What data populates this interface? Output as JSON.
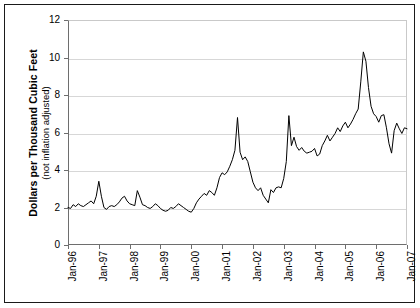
{
  "chart_data": {
    "type": "line",
    "title": "",
    "xlabel": "",
    "ylabel": "Dollars per Thousand Cubic Feet",
    "ylabel_sub": "(not inflation adjusted)",
    "ylim": [
      0,
      12
    ],
    "yticks": [
      0,
      2,
      4,
      6,
      8,
      10,
      12
    ],
    "ytick_labels": [
      "0",
      "2",
      "4",
      "6",
      "8",
      "10",
      "12"
    ],
    "grid": true,
    "grid_axis": "y",
    "legend": "none",
    "line_color": "#000000",
    "background_color": "#ffffff",
    "xtick_labels": [
      "Jan-96",
      "Jan-97",
      "Jan-98",
      "Jan-99",
      "Jan-00",
      "Jan-01",
      "Jan-02",
      "Jan-03",
      "Jan-04",
      "Jan-05",
      "Jan-06",
      "Jan-07"
    ],
    "xlim": [
      "Jan-96",
      "Jan-07"
    ],
    "x_start_index": 0,
    "x_points_per_tick": 12,
    "x": [
      "Jan-96",
      "Feb-96",
      "Mar-96",
      "Apr-96",
      "May-96",
      "Jun-96",
      "Jul-96",
      "Aug-96",
      "Sep-96",
      "Oct-96",
      "Nov-96",
      "Dec-96",
      "Jan-97",
      "Feb-97",
      "Mar-97",
      "Apr-97",
      "May-97",
      "Jun-97",
      "Jul-97",
      "Aug-97",
      "Sep-97",
      "Oct-97",
      "Nov-97",
      "Dec-97",
      "Jan-98",
      "Feb-98",
      "Mar-98",
      "Apr-98",
      "May-98",
      "Jun-98",
      "Jul-98",
      "Aug-98",
      "Sep-98",
      "Oct-98",
      "Nov-98",
      "Dec-98",
      "Jan-99",
      "Feb-99",
      "Mar-99",
      "Apr-99",
      "May-99",
      "Jun-99",
      "Jul-99",
      "Aug-99",
      "Sep-99",
      "Oct-99",
      "Nov-99",
      "Dec-99",
      "Jan-00",
      "Feb-00",
      "Mar-00",
      "Apr-00",
      "May-00",
      "Jun-00",
      "Jul-00",
      "Aug-00",
      "Sep-00",
      "Oct-00",
      "Nov-00",
      "Dec-00",
      "Jan-01",
      "Feb-01",
      "Mar-01",
      "Apr-01",
      "May-01",
      "Jun-01",
      "Jul-01",
      "Aug-01",
      "Sep-01",
      "Oct-01",
      "Nov-01",
      "Dec-01",
      "Jan-02",
      "Feb-02",
      "Mar-02",
      "Apr-02",
      "May-02",
      "Jun-02",
      "Jul-02",
      "Aug-02",
      "Sep-02",
      "Oct-02",
      "Nov-02",
      "Dec-02",
      "Jan-03",
      "Feb-03",
      "Mar-03",
      "Apr-03",
      "May-03",
      "Jun-03",
      "Jul-03",
      "Aug-03",
      "Sep-03",
      "Oct-03",
      "Nov-03",
      "Dec-03",
      "Jan-04",
      "Feb-04",
      "Mar-04",
      "Apr-04",
      "May-04",
      "Jun-04",
      "Jul-04",
      "Aug-04",
      "Sep-04",
      "Oct-04",
      "Nov-04",
      "Dec-04",
      "Jan-05",
      "Feb-05",
      "Mar-05",
      "Apr-05",
      "May-05",
      "Jun-05",
      "Jul-05",
      "Aug-05",
      "Sep-05",
      "Oct-05",
      "Nov-05",
      "Dec-05",
      "Jan-06",
      "Feb-06",
      "Mar-06",
      "Apr-06",
      "May-06",
      "Jun-06",
      "Jul-06",
      "Aug-06",
      "Sep-06",
      "Oct-06",
      "Nov-06",
      "Dec-06",
      "Jan-07"
    ],
    "values": [
      2.0,
      1.95,
      2.15,
      2.05,
      2.2,
      2.1,
      2.05,
      2.15,
      2.25,
      2.35,
      2.2,
      2.6,
      3.4,
      2.6,
      2.0,
      1.9,
      2.05,
      2.1,
      2.05,
      2.15,
      2.3,
      2.5,
      2.6,
      2.35,
      2.2,
      2.15,
      2.1,
      2.9,
      2.55,
      2.15,
      2.1,
      2.0,
      1.95,
      2.05,
      2.2,
      2.1,
      1.95,
      1.85,
      1.8,
      1.85,
      2.0,
      1.95,
      2.05,
      2.2,
      2.1,
      2.0,
      1.9,
      1.8,
      1.75,
      1.95,
      2.25,
      2.45,
      2.6,
      2.75,
      2.65,
      2.9,
      2.8,
      2.65,
      3.05,
      3.6,
      3.85,
      3.75,
      3.9,
      4.2,
      4.55,
      5.05,
      6.8,
      4.95,
      4.55,
      4.7,
      4.45,
      3.9,
      3.35,
      3.05,
      2.9,
      3.05,
      2.65,
      2.45,
      2.25,
      2.95,
      2.8,
      3.05,
      3.1,
      3.05,
      3.55,
      4.45,
      6.9,
      5.3,
      5.75,
      5.25,
      5.05,
      5.2,
      5.0,
      4.9,
      4.95,
      5.0,
      5.15,
      4.75,
      4.85,
      5.3,
      5.55,
      5.85,
      5.55,
      5.75,
      5.95,
      6.25,
      6.05,
      6.35,
      6.55,
      6.25,
      6.45,
      6.7,
      7.0,
      7.25,
      8.7,
      10.3,
      9.8,
      8.4,
      7.4,
      7.0,
      6.85,
      6.55,
      6.9,
      6.95,
      6.25,
      5.4,
      4.9,
      6.1,
      6.5,
      6.2,
      5.95,
      6.25,
      6.2
    ]
  }
}
